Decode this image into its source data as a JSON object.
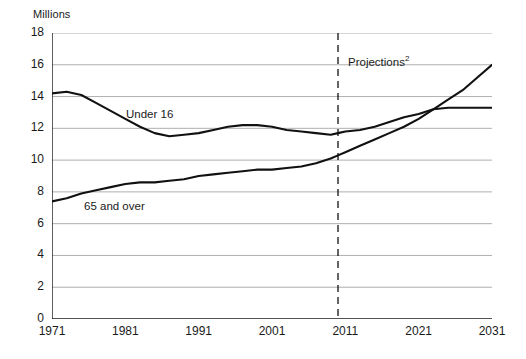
{
  "chart_data": {
    "type": "line",
    "title": "",
    "ylabel": "Millions",
    "xlabel": "",
    "ylim": [
      0,
      18
    ],
    "ytick_labels": [
      "0",
      "2",
      "4",
      "6",
      "8",
      "10",
      "12",
      "14",
      "16",
      "18"
    ],
    "ytick_values": [
      0,
      2,
      4,
      6,
      8,
      10,
      12,
      14,
      16,
      18
    ],
    "xlim": [
      1971,
      2031
    ],
    "xtick_labels": [
      "1971",
      "1981",
      "1991",
      "2001",
      "2011",
      "2021",
      "2031"
    ],
    "xtick_values": [
      1971,
      1981,
      1991,
      2001,
      2011,
      2021,
      2031
    ],
    "grid": "horizontal",
    "legend_position": "inline-labels",
    "annotations": [
      {
        "text": "Projections²",
        "x": 2012,
        "y": 16.4,
        "type": "text"
      },
      {
        "text": "Under 16",
        "x": 1988,
        "y": 12.9,
        "type": "series-label"
      },
      {
        "text": "65 and over",
        "x": 1977,
        "y": 6.6,
        "type": "series-label"
      }
    ],
    "vertical_reference_line": {
      "x": 2010,
      "style": "dashed",
      "label": "Projections²"
    },
    "x": [
      1971,
      1973,
      1975,
      1977,
      1979,
      1981,
      1983,
      1985,
      1987,
      1989,
      1991,
      1993,
      1995,
      1997,
      1999,
      2001,
      2003,
      2005,
      2007,
      2009,
      2010,
      2011,
      2013,
      2015,
      2017,
      2019,
      2021,
      2023,
      2025,
      2027,
      2029,
      2031
    ],
    "series": [
      {
        "name": "Under 16",
        "values": [
          14.2,
          14.3,
          14.1,
          13.6,
          13.1,
          12.6,
          12.1,
          11.7,
          11.5,
          11.6,
          11.7,
          11.9,
          12.1,
          12.2,
          12.2,
          12.1,
          11.9,
          11.8,
          11.7,
          11.6,
          11.7,
          11.8,
          11.9,
          12.1,
          12.4,
          12.7,
          12.9,
          13.2,
          13.3,
          13.3,
          13.3,
          13.3
        ]
      },
      {
        "name": "65 and over",
        "values": [
          7.4,
          7.6,
          7.9,
          8.1,
          8.3,
          8.5,
          8.6,
          8.6,
          8.7,
          8.8,
          9.0,
          9.1,
          9.2,
          9.3,
          9.4,
          9.4,
          9.5,
          9.6,
          9.8,
          10.1,
          10.3,
          10.5,
          10.9,
          11.3,
          11.7,
          12.1,
          12.6,
          13.2,
          13.8,
          14.4,
          15.2,
          16.0
        ]
      }
    ]
  }
}
